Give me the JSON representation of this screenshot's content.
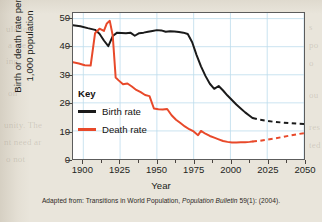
{
  "figure": {
    "caption_prefix": "Adapted from: Transitions in World Population, ",
    "caption_italic": "Population Bulletin",
    "caption_suffix": " 59(1): (2004)."
  },
  "legend": {
    "title": "Key",
    "entries": [
      {
        "label": "Birth rate",
        "color": "#1a1a1a"
      },
      {
        "label": "Death rate",
        "color": "#e8492a"
      }
    ]
  },
  "ghost_text": {
    "l1": "ulation",
    "l2": "a are",
    "l3": "ing",
    "l4": "on",
    "l5": "unity. The",
    "l6": "nt need ar",
    "l7": "o not",
    "r1": "s",
    "r2": "po",
    "r3": "o",
    "r4": "ou",
    "r5": "res",
    "r6": "ted"
  },
  "chart_data": {
    "type": "line",
    "title": "",
    "xlabel": "Year",
    "ylabel": "Birth or death rate per 1,000 population",
    "xlim": [
      1893,
      2050
    ],
    "ylim": [
      0,
      52
    ],
    "xticks": [
      1900,
      1925,
      1950,
      1975,
      2000,
      2025,
      2050
    ],
    "yticks": [
      0,
      10,
      20,
      30,
      40,
      50
    ],
    "grid": true,
    "grid_color": "#bcdcec",
    "legend_position": "inside-left",
    "projection_start": 2015,
    "series": [
      {
        "name": "Birth rate",
        "color": "#1a1a1a",
        "x": [
          1893,
          1898,
          1903,
          1908,
          1911,
          1914,
          1917,
          1920,
          1923,
          1926,
          1929,
          1932,
          1935,
          1938,
          1941,
          1944,
          1947,
          1950,
          1953,
          1956,
          1959,
          1962,
          1965,
          1968,
          1971,
          1974,
          1977,
          1980,
          1983,
          1986,
          1989,
          1992,
          1995,
          1998,
          2001,
          2004,
          2007,
          2010,
          2013,
          2015
        ],
        "y": [
          47.6,
          47.3,
          46.6,
          46.0,
          44.6,
          42.2,
          40.2,
          43.8,
          45.0,
          44.9,
          44.8,
          45.0,
          43.9,
          44.8,
          45.0,
          45.3,
          45.6,
          45.9,
          45.8,
          45.3,
          45.5,
          45.4,
          45.2,
          45.0,
          44.5,
          41.6,
          37.0,
          33.0,
          29.6,
          26.8,
          25.0,
          26.0,
          24.4,
          22.6,
          21.0,
          19.4,
          18.0,
          16.6,
          15.4,
          14.6
        ],
        "projection_x": [
          2015,
          2020,
          2025,
          2030,
          2035,
          2040,
          2045,
          2050
        ],
        "projection_y": [
          14.6,
          14.0,
          13.6,
          13.2,
          13.0,
          12.8,
          12.6,
          12.5
        ]
      },
      {
        "name": "Death rate",
        "color": "#e8492a",
        "x": [
          1893,
          1897,
          1901,
          1905,
          1908,
          1911,
          1914,
          1916,
          1918,
          1920,
          1922,
          1924,
          1927,
          1930,
          1933,
          1936,
          1939,
          1942,
          1945,
          1948,
          1951,
          1954,
          1957,
          1960,
          1963,
          1966,
          1969,
          1972,
          1975,
          1978,
          1980,
          1983,
          1986,
          1989,
          1992,
          1995,
          1998,
          2001,
          2004,
          2007,
          2010,
          2013,
          2015
        ],
        "y": [
          34.5,
          34.0,
          33.4,
          33.3,
          44.8,
          46.4,
          45.6,
          48.3,
          49.2,
          44.0,
          29.0,
          28.0,
          26.6,
          26.9,
          25.8,
          24.6,
          23.8,
          22.8,
          22.4,
          18.0,
          17.7,
          17.6,
          17.8,
          15.6,
          14.0,
          12.8,
          11.6,
          10.6,
          9.8,
          8.5,
          10.0,
          9.0,
          8.2,
          7.6,
          7.0,
          6.4,
          6.1,
          5.9,
          5.9,
          6.0,
          6.0,
          6.1,
          6.2
        ],
        "projection_x": [
          2015,
          2020,
          2025,
          2030,
          2035,
          2040,
          2045,
          2050
        ],
        "projection_y": [
          6.2,
          6.5,
          6.9,
          7.3,
          7.8,
          8.3,
          8.8,
          9.2
        ]
      }
    ]
  }
}
